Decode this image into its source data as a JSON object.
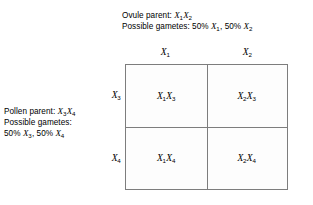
{
  "diagram": {
    "type": "punnett-square"
  },
  "ovule_parent": {
    "parent_line": "Ovule parent: ",
    "parent_genotype_1": "X",
    "parent_genotype_1_sub": "1",
    "parent_genotype_2": "X",
    "parent_genotype_2_sub": "2",
    "gametes_line": "Possible gametes: 50% ",
    "gamete_1": "X",
    "gamete_1_sub": "1",
    "gametes_separator": ", 50% ",
    "gamete_2": "X",
    "gamete_2_sub": "2"
  },
  "pollen_parent": {
    "parent_line": "Pollen parent: ",
    "parent_genotype_1": "X",
    "parent_genotype_1_sub": "3",
    "parent_genotype_2": "X",
    "parent_genotype_2_sub": "4",
    "gametes_label": "Possible gametes:",
    "gametes_percent_1": "50% ",
    "gamete_1": "X",
    "gamete_1_sub": "3",
    "gametes_separator": ", 50% ",
    "gamete_2": "X",
    "gamete_2_sub": "4"
  },
  "grid": {
    "column_headers": [
      {
        "symbol": "X",
        "subscript": "1"
      },
      {
        "symbol": "X",
        "subscript": "2"
      }
    ],
    "row_headers": [
      {
        "symbol": "X",
        "subscript": "3"
      },
      {
        "symbol": "X",
        "subscript": "4"
      }
    ],
    "cells": [
      [
        {
          "allele_a": "X",
          "allele_a_sub": "1",
          "allele_b": "X",
          "allele_b_sub": "3"
        },
        {
          "allele_a": "X",
          "allele_a_sub": "2",
          "allele_b": "X",
          "allele_b_sub": "3"
        }
      ],
      [
        {
          "allele_a": "X",
          "allele_a_sub": "1",
          "allele_b": "X",
          "allele_b_sub": "4"
        },
        {
          "allele_a": "X",
          "allele_a_sub": "2",
          "allele_b": "X",
          "allele_b_sub": "4"
        }
      ]
    ]
  },
  "colors": {
    "line": "#7d7d7d",
    "text": "#000000",
    "cell_background": "#fdfdfd",
    "page_background": "#ffffff"
  }
}
